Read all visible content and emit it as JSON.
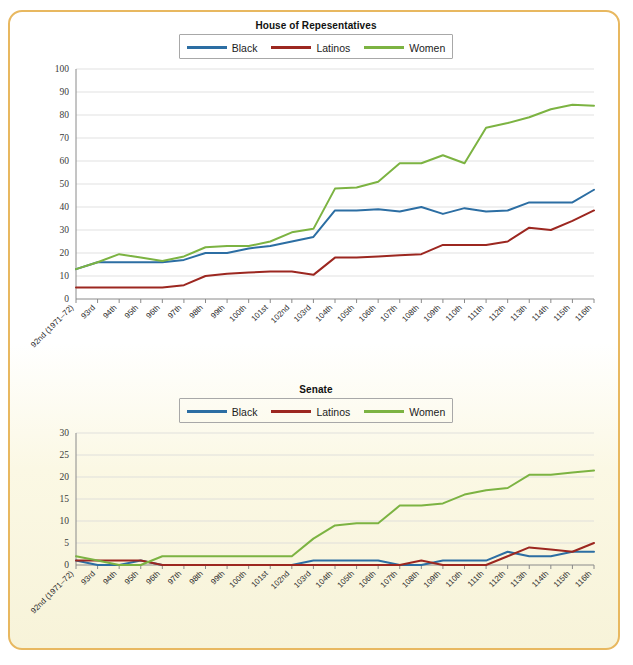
{
  "figure": {
    "border_color": "#e8b860",
    "background_top": "#ffffff",
    "background_bottom": "#f7f3d9"
  },
  "colors": {
    "black_series": "#2c6ea3",
    "latinos_series": "#9c2720",
    "women_series": "#7cb342",
    "grid": "#d9d9d9",
    "axis": "#8a8a8a"
  },
  "legend": {
    "black_label": "Black",
    "latinos_label": "Latinos",
    "women_label": "Women"
  },
  "chart_data": [
    {
      "type": "line",
      "id": "house",
      "title": "House of Repesentatives",
      "xlabel": "",
      "ylabel": "",
      "ylim": [
        0,
        100
      ],
      "ytick_step": 10,
      "yticks": [
        0,
        10,
        20,
        30,
        40,
        50,
        60,
        70,
        80,
        90,
        100
      ],
      "grid": true,
      "legend_position": "top-center",
      "categories": [
        "92nd (1971–72)",
        "93rd",
        "94th",
        "95th",
        "96th",
        "97th",
        "98th",
        "99th",
        "100th",
        "101st",
        "102nd",
        "103rd",
        "104th",
        "105th",
        "106th",
        "107th",
        "108th",
        "109th",
        "110th",
        "111th",
        "112th",
        "113th",
        "114th",
        "115th",
        "116th"
      ],
      "series": [
        {
          "name": "Black",
          "color": "#2c6ea3",
          "values": [
            13,
            16,
            16,
            16,
            16,
            17,
            20,
            20,
            22,
            23,
            25,
            27,
            38.5,
            38.5,
            39,
            38,
            40,
            37,
            39.5,
            38,
            38.5,
            42,
            42,
            42,
            47.5
          ]
        },
        {
          "name": "Latinos",
          "color": "#9c2720",
          "values": [
            5,
            5,
            5,
            5,
            5,
            6,
            10,
            11,
            11.5,
            12,
            12,
            10.5,
            18,
            18,
            18.5,
            19,
            19.5,
            23.5,
            23.5,
            23.5,
            25,
            31,
            30,
            34,
            38.5
          ]
        },
        {
          "name": "Women",
          "color": "#7cb342",
          "values": [
            13,
            16,
            19.5,
            18,
            16.5,
            18.5,
            22.5,
            23,
            23,
            25,
            29,
            30.5,
            48,
            48.5,
            51,
            59,
            59,
            62.5,
            59,
            74.5,
            76.5,
            79,
            82.5,
            84.5,
            84
          ]
        }
      ]
    },
    {
      "type": "line",
      "id": "senate",
      "title": "Senate",
      "xlabel": "",
      "ylabel": "",
      "ylim": [
        0,
        30
      ],
      "ytick_step": 5,
      "yticks": [
        0,
        5,
        10,
        15,
        20,
        25,
        30
      ],
      "grid": true,
      "legend_position": "top-center",
      "categories": [
        "92nd (1971–72)",
        "93rd",
        "94th",
        "95th",
        "96th",
        "97th",
        "98th",
        "99th",
        "100th",
        "101st",
        "102nd",
        "103rd",
        "104th",
        "105th",
        "106th",
        "107th",
        "108th",
        "109th",
        "110th",
        "111th",
        "112th",
        "113th",
        "114th",
        "115th",
        "116th"
      ],
      "series": [
        {
          "name": "Black",
          "color": "#2c6ea3",
          "values": [
            1,
            0,
            0,
            1,
            0,
            0,
            0,
            0,
            0,
            0,
            0,
            1,
            1,
            1,
            1,
            0,
            0,
            1,
            1,
            1,
            3,
            2,
            2,
            3,
            3
          ]
        },
        {
          "name": "Latinos",
          "color": "#9c2720",
          "values": [
            1,
            1,
            1,
            1,
            0,
            0,
            0,
            0,
            0,
            0,
            0,
            0,
            0,
            0,
            0,
            0,
            1,
            0,
            0,
            0,
            2,
            4,
            3.5,
            3,
            5
          ]
        },
        {
          "name": "Women",
          "color": "#7cb342",
          "values": [
            2,
            1,
            0,
            0,
            2,
            2,
            2,
            2,
            2,
            2,
            2,
            6,
            9,
            9.5,
            9.5,
            13.5,
            13.5,
            14,
            16,
            17,
            17.5,
            20.5,
            20.5,
            21,
            21.5
          ]
        }
      ]
    }
  ]
}
